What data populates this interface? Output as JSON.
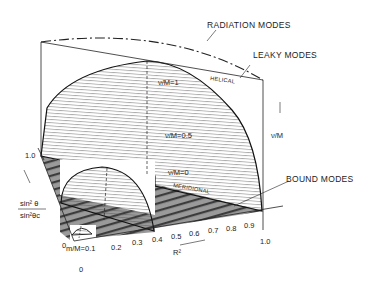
{
  "diagram": {
    "type": "3d-mode-diagram",
    "labels": {
      "radiation_modes": "RADIATION MODES",
      "leaky_modes": "LEAKY MODES",
      "helical": "HELICAL",
      "bound_modes": "BOUND MODES",
      "meridional": "MERIDIONAL",
      "nu_m_1": "ν/M=1",
      "nu_m_05": "ν/M=0.5",
      "nu_m_0": "ν/M=0",
      "nu_m_axis": "ν/M",
      "m_m_01": "m/M=0.1",
      "r2_axis": "R²",
      "sin_num": "sin² θ",
      "sin_den": "sin²θc",
      "y_one": "1.0",
      "origin_0": "0",
      "bottom_0": "0"
    },
    "r2_ticks": [
      "0.2",
      "0.3",
      "0.4",
      "0.5",
      "0.6",
      "0.7",
      "0.8",
      "0.9",
      "1.0"
    ]
  }
}
